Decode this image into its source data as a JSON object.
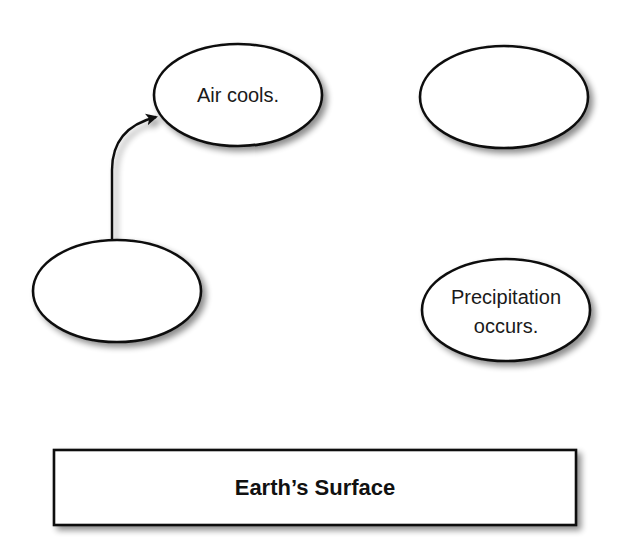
{
  "diagram": {
    "nodes": [
      {
        "id": "node-air-cools",
        "label": "Air cools.",
        "lines": [
          "Air cools."
        ],
        "shape": "ellipse",
        "cx": 238,
        "cy": 95,
        "rx": 84,
        "ry": 51
      },
      {
        "id": "node-top-right-blank",
        "label": "",
        "lines": [],
        "shape": "ellipse",
        "cx": 504,
        "cy": 97,
        "rx": 84,
        "ry": 51
      },
      {
        "id": "node-left-blank",
        "label": "",
        "lines": [],
        "shape": "ellipse",
        "cx": 117,
        "cy": 291,
        "rx": 84,
        "ry": 51
      },
      {
        "id": "node-precipitation",
        "label": "Precipitation occurs.",
        "lines": [
          "Precipitation",
          "occurs."
        ],
        "shape": "ellipse",
        "cx": 506,
        "cy": 310,
        "rx": 84,
        "ry": 51
      },
      {
        "id": "node-earth-surface",
        "label": "Earth’s Surface",
        "lines": [
          "Earth’s Surface"
        ],
        "shape": "rectangle",
        "x": 54,
        "y": 450,
        "width": 522,
        "height": 75
      }
    ],
    "edges": [
      {
        "from": "node-earth-surface",
        "to": "node-left-blank",
        "direction": "up"
      },
      {
        "from": "node-left-blank",
        "to": "node-air-cools",
        "direction": "curved-up-right"
      },
      {
        "from": "node-air-cools",
        "to": "node-top-right-blank",
        "direction": "right"
      },
      {
        "from": "node-top-right-blank",
        "to": "node-precipitation",
        "direction": "down"
      },
      {
        "from": "node-precipitation",
        "to": "node-earth-surface",
        "direction": "down"
      }
    ],
    "colors": {
      "stroke": "#111111",
      "fill": "#ffffff",
      "shadow": "#9a9a9a"
    }
  }
}
